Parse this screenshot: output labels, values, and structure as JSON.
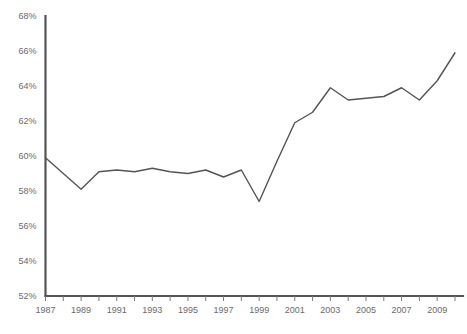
{
  "chart_data": {
    "type": "line",
    "title": "",
    "subtitle": "",
    "xlabel": "",
    "ylabel": "",
    "xlim": [
      1987,
      2010
    ],
    "ylim": [
      52,
      68
    ],
    "y_unit": "%",
    "y_tick_step": 2,
    "grid": false,
    "legend": null,
    "legend_position": "none",
    "x_tick_labels": [
      "1987",
      "1989",
      "1991",
      "1993",
      "1995",
      "1997",
      "1999",
      "2001",
      "2003",
      "2005",
      "2007",
      "2009"
    ],
    "y_tick_labels": [
      "52%",
      "54%",
      "56%",
      "58%",
      "60%",
      "62%",
      "64%",
      "66%",
      "68%"
    ],
    "y_tick_values": [
      52,
      54,
      56,
      58,
      60,
      62,
      64,
      66,
      68
    ],
    "minor_x_ticks_every_year": true,
    "x": [
      1987,
      1988,
      1989,
      1990,
      1991,
      1992,
      1993,
      1994,
      1995,
      1996,
      1997,
      1998,
      1999,
      2000,
      2001,
      2002,
      2003,
      2004,
      2005,
      2006,
      2007,
      2008,
      2009,
      2010
    ],
    "series": [
      {
        "name": "value",
        "color": "#545454",
        "values": [
          59.9,
          59.0,
          58.1,
          59.1,
          59.2,
          59.1,
          59.3,
          59.1,
          59.0,
          59.2,
          58.8,
          59.2,
          57.4,
          59.7,
          61.9,
          62.5,
          63.9,
          63.2,
          63.3,
          63.4,
          63.9,
          63.2,
          64.3,
          65.9
        ]
      }
    ],
    "axis_color": "#545454",
    "tick_color": "#7a7a7a",
    "label_color": "#6b6b6b",
    "background_color": "#ffffff"
  }
}
